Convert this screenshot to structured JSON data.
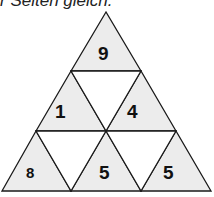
{
  "caption": "r Seiten gleich.",
  "puzzle": {
    "fill_color": "#ececec",
    "line_color": "#1a1a1a",
    "cells": [
      {
        "id": "top",
        "value": "9"
      },
      {
        "id": "mid-left",
        "value": "1"
      },
      {
        "id": "mid-center",
        "value": ""
      },
      {
        "id": "mid-right",
        "value": "4"
      },
      {
        "id": "bottom-left",
        "value": "8"
      },
      {
        "id": "bottom-inv-left",
        "value": ""
      },
      {
        "id": "bottom-center",
        "value": "5"
      },
      {
        "id": "bottom-inv-right",
        "value": ""
      },
      {
        "id": "bottom-right",
        "value": "5"
      }
    ]
  }
}
